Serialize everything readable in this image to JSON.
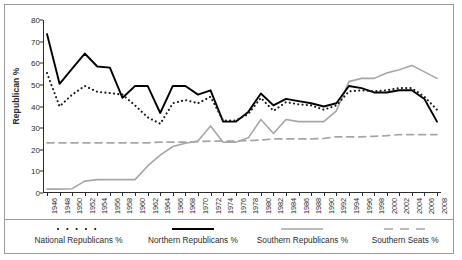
{
  "chart_data": {
    "type": "line",
    "title": "",
    "xlabel": "",
    "ylabel": "Republican %",
    "ylim": [
      0,
      80
    ],
    "ytick_step": 10,
    "grid": false,
    "legend_position": "bottom",
    "yticks": [
      "0",
      "10",
      "20",
      "30",
      "40",
      "50",
      "60",
      "70",
      "80"
    ],
    "categories": [
      "1946",
      "1948",
      "1950",
      "1952",
      "1954",
      "1956",
      "1958",
      "1960",
      "1962",
      "1964",
      "1966",
      "1968",
      "1970",
      "1972",
      "1974",
      "1976",
      "1978",
      "1980",
      "1982",
      "1984",
      "1986",
      "1988",
      "1990",
      "1992",
      "1994",
      "1996",
      "1998",
      "2000",
      "2002",
      "2004",
      "2006",
      "2008"
    ],
    "series": [
      {
        "name": "National Republicans %",
        "color": "#1a1a1a",
        "style": "dotted",
        "values": [
          55.5,
          40.0,
          45.5,
          49.5,
          46.8,
          46.2,
          45.5,
          40.5,
          35.0,
          32.0,
          41.5,
          43.0,
          41.5,
          44.5,
          33.5,
          33.5,
          36.5,
          44.0,
          38.0,
          42.0,
          41.0,
          40.5,
          38.5,
          40.5,
          47.0,
          47.5,
          47.0,
          47.5,
          48.5,
          48.5,
          44.5,
          38.5
        ]
      },
      {
        "name": "Northern Republicans %",
        "color": "#000000",
        "style": "solid",
        "values": [
          73.5,
          50.5,
          57.5,
          64.5,
          58.5,
          58.0,
          44.0,
          49.5,
          49.5,
          37.0,
          49.5,
          49.5,
          45.5,
          47.5,
          33.0,
          33.0,
          37.5,
          46.0,
          40.5,
          43.5,
          42.5,
          41.5,
          40.0,
          41.5,
          49.5,
          48.5,
          46.5,
          46.5,
          47.5,
          47.5,
          43.5,
          33.0
        ]
      },
      {
        "name": "Southern Republicans %",
        "color": "#a6a6a6",
        "style": "solid",
        "values": [
          1.8,
          1.8,
          2.0,
          5.5,
          6.2,
          6.2,
          6.2,
          6.2,
          12.5,
          17.5,
          21.5,
          23.0,
          24.0,
          31.0,
          23.5,
          23.5,
          25.5,
          34.0,
          27.5,
          34.0,
          33.0,
          33.0,
          33.0,
          38.0,
          51.5,
          53.0,
          53.0,
          55.5,
          57.0,
          59.0,
          56.0,
          53.0
        ]
      },
      {
        "name": "Southern Seats %",
        "color": "#a6a6a6",
        "style": "dashed",
        "values": [
          23.2,
          23.2,
          23.2,
          23.2,
          23.2,
          23.2,
          23.2,
          23.2,
          23.2,
          23.5,
          23.5,
          23.5,
          23.8,
          24.0,
          24.0,
          24.0,
          24.2,
          24.5,
          25.0,
          25.0,
          25.0,
          25.0,
          25.2,
          26.0,
          26.0,
          26.0,
          26.2,
          26.5,
          27.0,
          27.0,
          27.0,
          27.0
        ]
      }
    ]
  },
  "legend": [
    {
      "label": "National Republicans %"
    },
    {
      "label": "Northern Republicans %"
    },
    {
      "label": "Southern Republicans %"
    },
    {
      "label": "Southern Seats %"
    }
  ]
}
